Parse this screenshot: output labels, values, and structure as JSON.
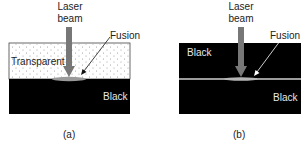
{
  "panels": [
    {
      "id": "a",
      "caption": "(a)",
      "beam_label_line1": "Laser",
      "beam_label_line2": "beam",
      "fusion_label": "Fusion",
      "top_layer_label": "Transparent",
      "bottom_layer_label": "Black"
    },
    {
      "id": "b",
      "caption": "(b)",
      "beam_label_line1": "Laser",
      "beam_label_line2": "beam",
      "fusion_label": "Fusion",
      "top_layer_label": "Black",
      "bottom_layer_label": "Black"
    }
  ],
  "colors": {
    "black_layer": "#000000",
    "transparent_layer": "#ffffff",
    "beam": "#777777",
    "fusion": "#9a9a9a",
    "text_dark": "#222222",
    "text_light": "#e8e8e8"
  }
}
